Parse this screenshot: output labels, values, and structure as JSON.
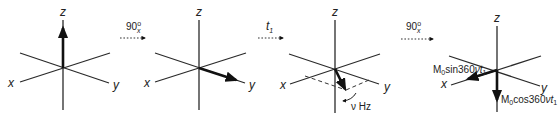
{
  "diagram": {
    "type": "vector-rotation-sequence",
    "panels": [
      {
        "id": 1,
        "axes": {
          "x": "x",
          "y": "y",
          "z": "z"
        },
        "vector": "along +z"
      },
      {
        "id": 2,
        "axes": {
          "x": "x",
          "y": "y",
          "z": "z"
        },
        "vector": "along +y"
      },
      {
        "id": 3,
        "axes": {
          "x": "x",
          "y": "y",
          "z": "z"
        },
        "vector": "in xy-plane, precessing",
        "precession_label": "ν Hz"
      },
      {
        "id": 4,
        "axes": {
          "x": "x",
          "y": "y",
          "z": "z"
        },
        "components": [
          {
            "label_prefix": "M",
            "label_sub": "0",
            "label_main": "sin360",
            "label_var": "νt",
            "label_var_sub": "1",
            "direction": "along x"
          },
          {
            "label_prefix": "M",
            "label_sub": "0",
            "label_main": "cos360",
            "label_var": "νt",
            "label_var_sub": "1",
            "direction": "along -z"
          }
        ]
      }
    ],
    "transitions": [
      {
        "label": "90",
        "sup": "o",
        "sub": "x"
      },
      {
        "label": "t",
        "sub": "1"
      },
      {
        "label": "90",
        "sup": "o",
        "sub": "x"
      }
    ]
  },
  "labels": {
    "z": "z",
    "x": "x",
    "y": "y",
    "nu_hz": "ν Hz",
    "pulse_main": "90",
    "pulse_sup": "o",
    "pulse_sub": "x",
    "delay_main": "t",
    "delay_sub": "1",
    "m0": "M",
    "m0_sub": "0",
    "sin_text": "sin360",
    "cos_text": "cos360",
    "nu_t": "νt",
    "nu_t_sub": "1"
  }
}
